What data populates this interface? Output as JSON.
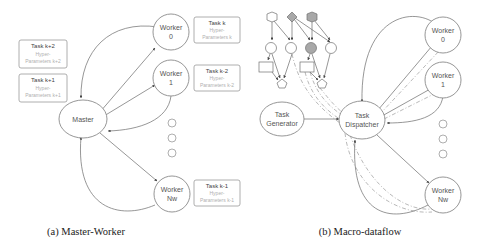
{
  "panel_a": {
    "caption": "(a) Master-Worker",
    "master": {
      "label": "Master"
    },
    "workers": [
      {
        "line1": "Worker",
        "line2": "0"
      },
      {
        "line1": "Worker",
        "line2": "1"
      },
      {
        "line1": "Worker",
        "line2": "Nw"
      }
    ],
    "tasks": [
      {
        "title": "Task k+2",
        "sub1": "Hyper-",
        "sub2": "Parameters k+2"
      },
      {
        "title": "Task k+1",
        "sub1": "Hyper-",
        "sub2": "Parameters k+1"
      },
      {
        "title": "Task k",
        "sub1": "Hyper-",
        "sub2": "Parameters k"
      },
      {
        "title": "Task k-2",
        "sub1": "Hyper-",
        "sub2": "Parameters k-2"
      },
      {
        "title": "Task k-1",
        "sub1": "Hyper-",
        "sub2": "Parameters k-1"
      }
    ]
  },
  "panel_b": {
    "caption": "(b) Macro-dataflow",
    "generator": {
      "line1": "Task",
      "line2": "Generator"
    },
    "dispatcher": {
      "line1": "Task",
      "line2": "Dispatcher"
    },
    "workers": [
      {
        "line1": "Worker",
        "line2": "0"
      },
      {
        "line1": "Worker",
        "line2": "1"
      },
      {
        "line1": "Worker",
        "line2": "Nw"
      }
    ]
  },
  "colors": {
    "node_stroke": "#8a8a8a",
    "gray_node_fill": "#a8a8a8",
    "text": "#555555"
  }
}
